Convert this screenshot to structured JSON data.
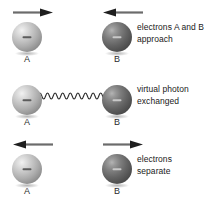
{
  "figure": {
    "background": "#ffffff",
    "particle_light_color": "#adadad",
    "particle_dark_color": "#636363",
    "charge_symbol": "−"
  },
  "rows": [
    {
      "id": "approach",
      "caption_lines": [
        "electrons A and B",
        "approach"
      ],
      "particles": [
        {
          "label": "A",
          "shade": "light",
          "arrow": "right",
          "charge": "−"
        },
        {
          "label": "B",
          "shade": "dark",
          "arrow": "left",
          "charge": "−"
        }
      ],
      "photon": false
    },
    {
      "id": "exchange",
      "caption_lines": [
        "virtual photon",
        "exchanged"
      ],
      "particles": [
        {
          "label": "A",
          "shade": "light",
          "arrow": "none",
          "charge": "−"
        },
        {
          "label": "B",
          "shade": "dark",
          "arrow": "none",
          "charge": "−"
        }
      ],
      "photon": true,
      "photon_cycles": 9
    },
    {
      "id": "separate",
      "caption_lines": [
        "electrons",
        "separate"
      ],
      "particles": [
        {
          "label": "A",
          "shade": "light",
          "arrow": "left",
          "charge": "−"
        },
        {
          "label": "B",
          "shade": "dark",
          "arrow": "right",
          "charge": "−"
        }
      ],
      "photon": false
    }
  ]
}
